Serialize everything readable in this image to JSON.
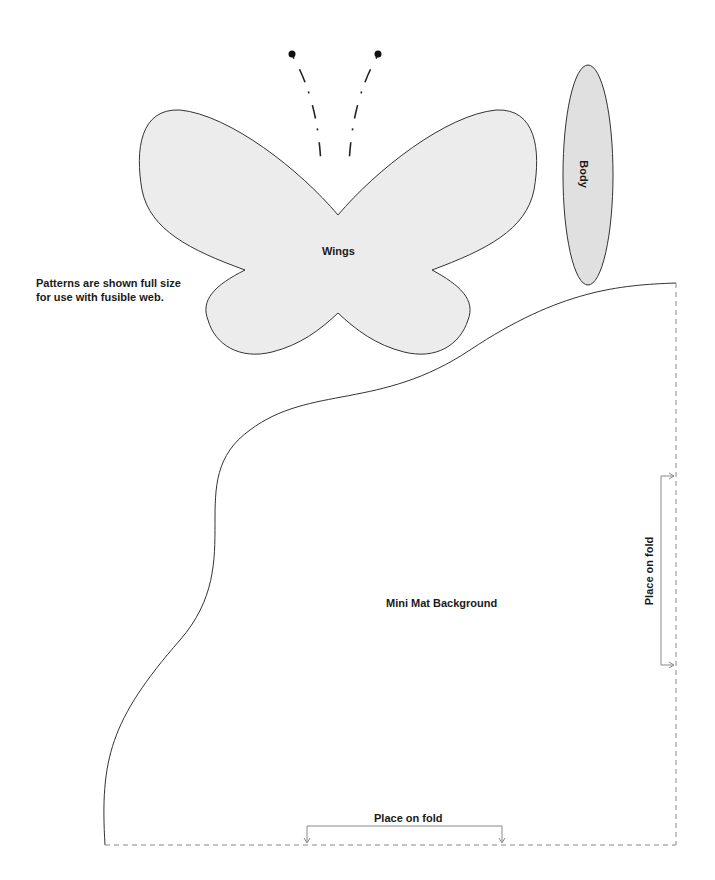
{
  "note": {
    "line1": "Patterns are shown full size",
    "line2": "for use with fusible web."
  },
  "pieces": {
    "wings": {
      "label": "Wings",
      "fill": "#ececec"
    },
    "body": {
      "label": "Body",
      "fill": "#e0e0e0"
    },
    "background": {
      "label": "Mini Mat Background",
      "fill": "#ffffff"
    }
  },
  "fold_markers": {
    "right": {
      "label": "Place on fold"
    },
    "bottom": {
      "label": "Place on fold"
    }
  },
  "colors": {
    "outline": "#333333",
    "dashed": "#888888",
    "arrow": "#888888"
  }
}
